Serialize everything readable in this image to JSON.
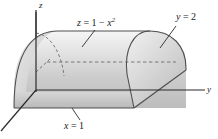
{
  "figure": {
    "background": "#ffffff",
    "width": 218,
    "height": 139
  },
  "axes": {
    "z_label": "z",
    "y_label": "y",
    "x_label_implicit": "x",
    "axis_color": "#2b2b2b",
    "origin": {
      "x": 36,
      "y": 90
    }
  },
  "labels": {
    "surface_equation": {
      "lhs": "z",
      "eq": "=",
      "rhs_num": "1",
      "minus": "−",
      "var": "x",
      "exp": "2"
    },
    "plane_y": {
      "lhs": "y",
      "eq": "=",
      "value": "2"
    },
    "plane_x": {
      "lhs": "x",
      "eq": "=",
      "value": "1"
    }
  },
  "colors": {
    "surface_light": "#f2f2f2",
    "surface_mid": "#cfcfcf",
    "surface_dark": "#b4b4b4",
    "endcap_light": "#ededed",
    "endcap_dark": "#c3c3c3",
    "outline": "#4a4a4a",
    "dashed": "#6b6b6b",
    "leader": "#2b2b2b"
  },
  "geometry": {
    "type": "parabolic-cylinder",
    "description": "Solid bounded by z = 1 - x^2, the planes y = 0, y = 2, x = 0 region, and z = 0",
    "bounds": {
      "x_max": 1,
      "y_max": 2,
      "z_max": 1
    }
  }
}
